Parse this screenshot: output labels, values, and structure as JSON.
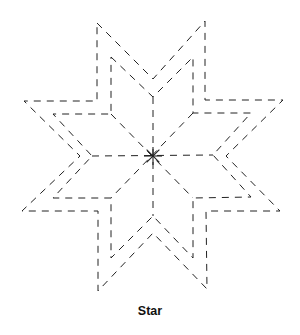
{
  "figure": {
    "caption": "Star",
    "stroke_color": "#222222",
    "background": "#ffffff",
    "center": [
      153,
      156
    ],
    "outer_outline": [
      [
        97,
        23
      ],
      [
        153,
        79
      ],
      [
        205,
        21
      ],
      [
        205,
        100
      ],
      [
        283,
        100
      ],
      [
        226,
        156
      ],
      [
        280,
        211
      ],
      [
        206,
        211
      ],
      [
        207,
        289
      ],
      [
        153,
        233
      ],
      [
        98,
        291
      ],
      [
        98,
        211
      ],
      [
        22,
        211
      ],
      [
        80,
        156
      ],
      [
        24,
        101
      ],
      [
        97,
        101
      ]
    ],
    "inner_outline": [
      [
        111,
        57
      ],
      [
        153,
        97
      ],
      [
        193,
        57
      ],
      [
        193,
        113
      ],
      [
        251,
        113
      ],
      [
        213,
        155
      ],
      [
        251,
        197
      ],
      [
        193,
        198
      ],
      [
        193,
        258
      ],
      [
        153,
        216
      ],
      [
        111,
        258
      ],
      [
        111,
        198
      ],
      [
        53,
        198
      ],
      [
        92,
        156
      ],
      [
        53,
        114
      ],
      [
        111,
        114
      ]
    ],
    "center_spokes": [
      [
        [
          153,
          97
        ],
        [
          153,
          216
        ]
      ],
      [
        [
          92,
          156
        ],
        [
          213,
          155
        ]
      ],
      [
        [
          111,
          114
        ],
        [
          193,
          198
        ]
      ],
      [
        [
          193,
          113
        ],
        [
          111,
          198
        ]
      ]
    ]
  }
}
